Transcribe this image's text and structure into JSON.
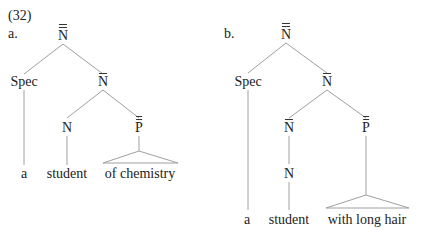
{
  "example_number": "(32)",
  "trees": [
    {
      "label": "a.",
      "root": "N",
      "root_bars": 2,
      "spec": "Spec",
      "nbar": "N",
      "n": "N",
      "pp": "P",
      "words": [
        "a",
        "student",
        "of chemistry"
      ]
    },
    {
      "label": "b.",
      "root": "N",
      "root_bars": 2,
      "spec": "Spec",
      "nbar": "N",
      "inner_nbar": "N",
      "n": "N",
      "pp": "P",
      "words": [
        "a",
        "student",
        "with long hair"
      ]
    }
  ],
  "colors": {
    "line": "#9a9a9a",
    "text": "#222222"
  }
}
